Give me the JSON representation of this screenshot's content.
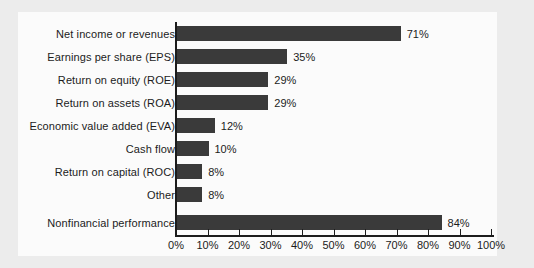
{
  "chart_data": {
    "type": "bar",
    "orientation": "horizontal",
    "title": "",
    "subtitle": "",
    "xlabel": "",
    "ylabel": "",
    "xlim": [
      0,
      100
    ],
    "grid": false,
    "legend": null,
    "tick_labels": [
      "0%",
      "10%",
      "20%",
      "30%",
      "40%",
      "50%",
      "60%",
      "70%",
      "80%",
      "90%",
      "100%"
    ],
    "tick_values": [
      0,
      10,
      20,
      30,
      40,
      50,
      60,
      70,
      80,
      90,
      100
    ],
    "bar_color": "#3a3a3a",
    "plot_background": "#fbfbfb",
    "page_background": "#ececec",
    "categories": [
      "Net income or revenues",
      "Earnings per share (EPS)",
      "Return on equity (ROE)",
      "Return on assets (ROA)",
      "Economic value added (EVA)",
      "Cash flow",
      "Return on capital (ROC)",
      "Other",
      "Nonfinancial performance"
    ],
    "values": [
      71,
      35,
      29,
      29,
      12,
      10,
      8,
      8,
      84
    ],
    "value_labels": [
      "71%",
      "35%",
      "29%",
      "29%",
      "12%",
      "10%",
      "8%",
      "8%",
      "84%"
    ]
  }
}
